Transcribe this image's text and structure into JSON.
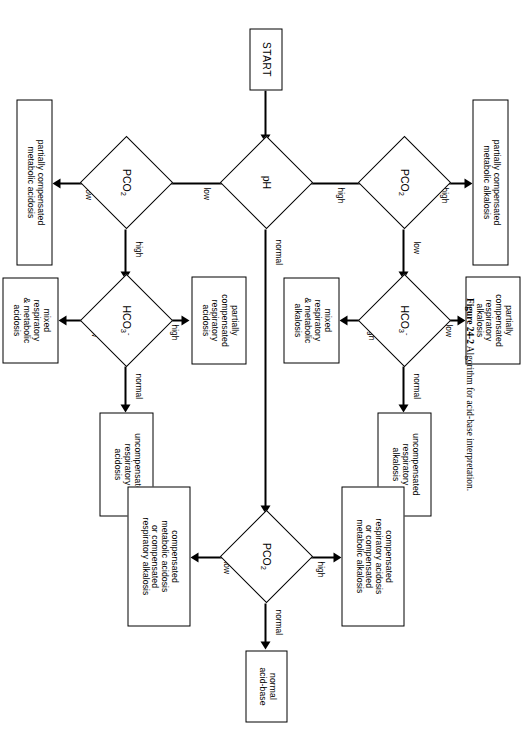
{
  "figure": {
    "caption_label": "Figure 24-2",
    "caption_text": "Algorithm for acid-base interpretation."
  },
  "nodes": {
    "start": {
      "label": "START"
    },
    "ph": {
      "label": "pH"
    },
    "pco2_high": {
      "label": "PCO",
      "sub": "2"
    },
    "pco2_low": {
      "label": "PCO",
      "sub": "2"
    },
    "pco2_normal": {
      "label": "PCO",
      "sub": "2"
    },
    "hco3_alkalosis": {
      "label": "HCO",
      "sub": "3",
      "sup": "-"
    },
    "hco3_acidosis": {
      "label": "HCO",
      "sub": "3",
      "sup": "-"
    },
    "partially_compensated_metabolic_alkalosis": {
      "line1": "partially compensated",
      "line2": "metabolic alkalosis"
    },
    "partially_compensated_respiratory_alkalosis": {
      "line1": "partially",
      "line2": "compensated",
      "line3": "respiratory",
      "line4": "alkalosis"
    },
    "uncompensated_respiratory_alkalosis": {
      "line1": "uncompensated",
      "line2": "respiratory",
      "line3": "alkalosis"
    },
    "mixed_respiratory_metabolic_alkalosis": {
      "line1": "mixed",
      "line2": "respiratory",
      "line3": "& metabolic",
      "line4": "alkalosis"
    },
    "partially_compensated_metabolic_acidosis": {
      "line1": "partially compensated",
      "line2": "metabolic acidosis"
    },
    "partially_compensated_respiratory_acidosis": {
      "line1": "partially",
      "line2": "compensated",
      "line3": "respiratory",
      "line4": "acidosis"
    },
    "uncompensated_respiratory_acidosis": {
      "line1": "uncompensated",
      "line2": "respiratory",
      "line3": "acidosis"
    },
    "mixed_respiratory_metabolic_acidosis": {
      "line1": "mixed",
      "line2": "respiratory",
      "line3": "& metabolic",
      "line4": "acidosis"
    },
    "compensated_respiratory_acidosis_or_metabolic_alkalosis": {
      "line1": "compensated",
      "line2": "respiratory acidosis",
      "line3": "or compensated",
      "line4": "metabolic alkalosis"
    },
    "compensated_metabolic_acidosis_or_respiratory_alkalosis": {
      "line1": "compensated",
      "line2": "metabolic acidosis",
      "line3": "or compensated",
      "line4": "respiratory alkalosis"
    },
    "normal_acid_base": {
      "line1": "normal",
      "line2": "acid-base"
    }
  },
  "edges": {
    "ph_high": "high",
    "ph_low": "low",
    "ph_normal": "normal",
    "pco2high_high": "high",
    "pco2high_low": "low",
    "hco3alk_low": "low",
    "hco3alk_high": "high",
    "hco3alk_normal": "normal",
    "pco2low_low": "low",
    "pco2low_high": "high",
    "hco3acid_high": "high",
    "hco3acid_low": "low",
    "hco3acid_normal": "normal",
    "pco2norm_high": "high",
    "pco2norm_low": "low",
    "pco2norm_normal": "normal"
  }
}
